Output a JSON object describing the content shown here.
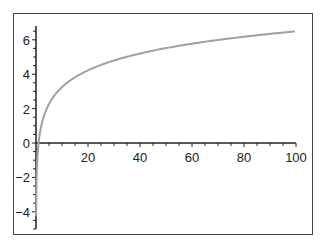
{
  "chart_data": {
    "type": "line",
    "title": "",
    "xlabel": "",
    "ylabel": "",
    "xlim": [
      0,
      100
    ],
    "ylim": [
      -5,
      6.8
    ],
    "x_ticks": [
      20,
      40,
      60,
      80,
      100
    ],
    "x_tick_labels": [
      "20",
      "40",
      "60",
      "80",
      "100"
    ],
    "y_ticks": [
      -4,
      -2,
      0,
      2,
      4,
      6
    ],
    "y_tick_labels": [
      "-4",
      "-2",
      "0",
      "2",
      "4",
      "6"
    ],
    "grid": false,
    "legend": null,
    "series": [
      {
        "name": "curve",
        "color": "#a0a0a0",
        "function_hint": "approx 1.41*ln(x)",
        "x": [
          0.5,
          1,
          2,
          3,
          5,
          8,
          10,
          15,
          20,
          30,
          40,
          50,
          60,
          70,
          80,
          90,
          100
        ],
        "y": [
          -0.98,
          0,
          0.98,
          1.55,
          2.27,
          2.93,
          3.25,
          3.82,
          4.22,
          4.8,
          5.2,
          5.52,
          5.77,
          5.99,
          6.18,
          6.34,
          6.49
        ]
      }
    ],
    "colors": {
      "axis": "#222222",
      "frame": "#444444",
      "line": "#a0a0a0"
    }
  }
}
